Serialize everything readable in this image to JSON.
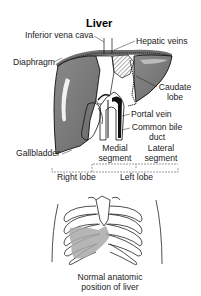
{
  "diagram": {
    "title": "Liver",
    "labels": {
      "inferior_vena_cava": "Inferior vena cava",
      "hepatic_veins": "Hepatic veins",
      "diaphragm": "Diaphragm",
      "caudate_lobe_1": "Caudate",
      "caudate_lobe_2": "lobe",
      "portal_vein": "Portal vein",
      "common_bile_duct_1": "Common bile",
      "common_bile_duct_2": "duct",
      "gallbladder": "Gallbladder",
      "medial_segment_1": "Medial",
      "medial_segment_2": "segment",
      "lateral_segment_1": "Lateral",
      "lateral_segment_2": "segment",
      "right_lobe": "Right lobe",
      "left_lobe": "Left lobe"
    },
    "caption_1": "Normal anatomic",
    "caption_2": "position of liver",
    "colors": {
      "liver_fill": "#7a7a7a",
      "liver_fill_light": "#a9a9a9",
      "outline": "#1a1a1a",
      "background": "#ffffff"
    }
  }
}
